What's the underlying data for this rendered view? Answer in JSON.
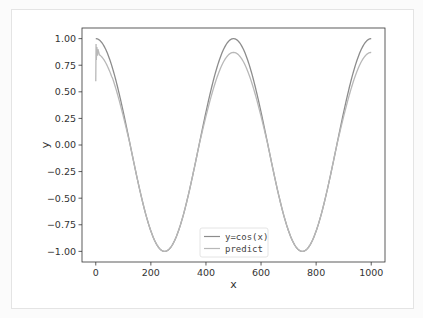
{
  "chart_data": {
    "type": "line",
    "title": "",
    "xlabel": "x",
    "ylabel": "y",
    "xlim": [
      -50,
      1050
    ],
    "ylim": [
      -1.1,
      1.1
    ],
    "xticks": [
      0,
      200,
      400,
      600,
      800,
      1000
    ],
    "xtick_labels": [
      "0",
      "200",
      "400",
      "600",
      "800",
      "1000"
    ],
    "yticks": [
      1.0,
      0.75,
      0.5,
      0.25,
      0.0,
      -0.25,
      -0.5,
      -0.75,
      -1.0
    ],
    "ytick_labels": [
      "1.00",
      "0.75",
      "0.50",
      "0.25",
      "0.00",
      "−0.25",
      "−0.50",
      "−0.75",
      "−1.00"
    ],
    "grid": false,
    "legend_position": "lower-center",
    "series": [
      {
        "name": "y=cos(x)",
        "color": "#8c8c8c",
        "function": "cos(2*pi*x/500)",
        "x_range": [
          0,
          1000
        ],
        "points": [
          [
            0,
            1.0
          ],
          [
            62.5,
            0.707
          ],
          [
            125,
            0.0
          ],
          [
            187.5,
            -0.707
          ],
          [
            250,
            -1.0
          ],
          [
            312.5,
            -0.707
          ],
          [
            375,
            0.0
          ],
          [
            437.5,
            0.707
          ],
          [
            500,
            1.0
          ],
          [
            562.5,
            0.707
          ],
          [
            625,
            0.0
          ],
          [
            687.5,
            -0.707
          ],
          [
            750,
            -1.0
          ],
          [
            812.5,
            -0.707
          ],
          [
            875,
            0.0
          ],
          [
            937.5,
            0.707
          ],
          [
            1000,
            1.0
          ]
        ]
      },
      {
        "name": "predict",
        "color": "#b8b8b8",
        "x_range": [
          0,
          1000
        ],
        "points": [
          [
            0,
            0.6
          ],
          [
            1,
            0.95
          ],
          [
            2,
            0.8
          ],
          [
            4,
            0.92
          ],
          [
            6,
            0.84
          ],
          [
            8,
            0.9
          ],
          [
            12,
            0.86
          ],
          [
            30,
            0.82
          ],
          [
            62.5,
            0.64
          ],
          [
            125,
            0.0
          ],
          [
            187.5,
            -0.71
          ],
          [
            250,
            -1.0
          ],
          [
            312.5,
            -0.71
          ],
          [
            375,
            0.0
          ],
          [
            437.5,
            0.63
          ],
          [
            500,
            0.87
          ],
          [
            562.5,
            0.63
          ],
          [
            625,
            0.0
          ],
          [
            687.5,
            -0.71
          ],
          [
            750,
            -1.0
          ],
          [
            812.5,
            -0.71
          ],
          [
            875,
            0.0
          ],
          [
            937.5,
            0.63
          ],
          [
            1000,
            0.87
          ]
        ]
      }
    ]
  }
}
